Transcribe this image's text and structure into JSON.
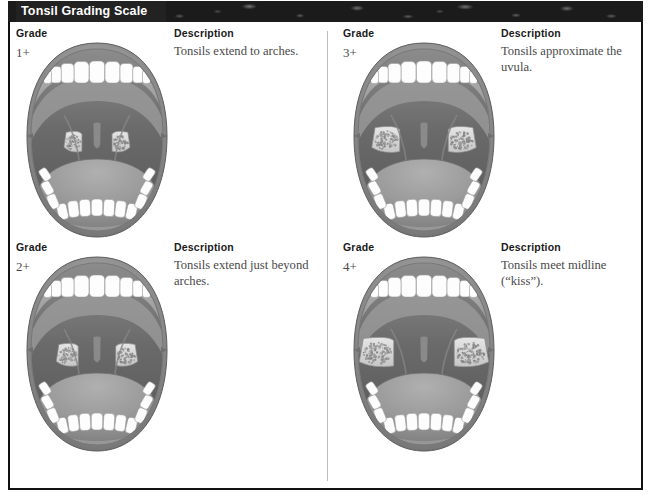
{
  "figure": {
    "title": "Tonsil Grading Scale",
    "column_headers": {
      "grade": "Grade",
      "description": "Description"
    }
  },
  "colors": {
    "banner_bg": "#1b1b1b",
    "banner_text": "#ffffff",
    "frame_border": "#111111",
    "divider": "#bdbdbd",
    "page_bg": "#ffffff",
    "lip": "#8f8f8f",
    "oral_cavity": "#6e6e6e",
    "tooth": "#fdfdfd",
    "tongue": "#9a9a9a",
    "palate": "#a2a2a2",
    "tonsil": "#dcdcdc",
    "text_body": "#4a4a4a",
    "text_header": "#1a1a1a"
  },
  "grades": [
    {
      "id": "grade-1-plus",
      "grade_label": "Grade",
      "grade_value": "1+",
      "description_label": "Description",
      "description_text": "Tonsils extend to arches.",
      "tonsil_size": 0.22,
      "position": "top-left"
    },
    {
      "id": "grade-2-plus",
      "grade_label": "Grade",
      "grade_value": "2+",
      "description_label": "Description",
      "description_text": "Tonsils extend just beyond arches.",
      "tonsil_size": 0.38,
      "position": "bottom-left"
    },
    {
      "id": "grade-3-plus",
      "grade_label": "Grade",
      "grade_value": "3+",
      "description_label": "Description",
      "description_text": "Tonsils approximate the uvula.",
      "tonsil_size": 0.62,
      "position": "top-right"
    },
    {
      "id": "grade-4-plus",
      "grade_label": "Grade",
      "grade_value": "4+",
      "description_label": "Description",
      "description_text": "Tonsils meet midline (“kiss”).",
      "tonsil_size": 0.88,
      "position": "bottom-right"
    }
  ]
}
